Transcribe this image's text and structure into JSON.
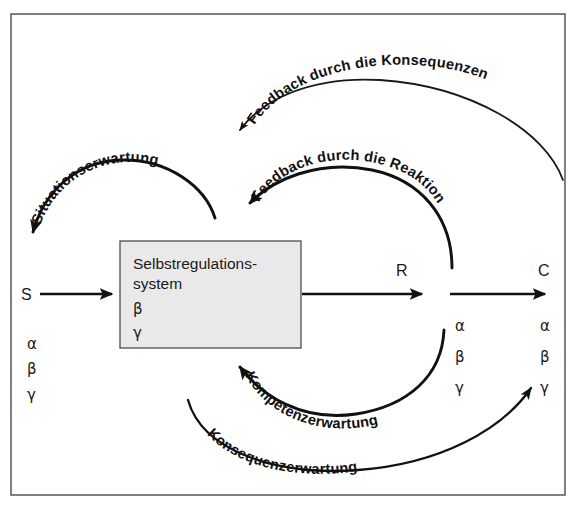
{
  "diagram": {
    "frame": {
      "border_color": "#4a4a4a"
    },
    "box": {
      "line1": "Selbstregulations-",
      "line2": "system",
      "greek": [
        "β",
        "γ"
      ],
      "fill_color": "#e9e9e9",
      "stroke_color": "#4d4d4d"
    },
    "nodes": [
      {
        "id": "S",
        "label": "S",
        "greek": [
          "α",
          "β",
          "γ"
        ]
      },
      {
        "id": "R",
        "label": "R",
        "greek": [
          "α",
          "β",
          "γ"
        ]
      },
      {
        "id": "C",
        "label": "C",
        "greek": [
          "α",
          "β",
          "γ"
        ]
      }
    ],
    "arcs": [
      {
        "id": "situationserwartung",
        "label": "Situationserwartung"
      },
      {
        "id": "feedback-konsequenzen",
        "label": "Feedback durch die Konsequenzen"
      },
      {
        "id": "feedback-reaktion",
        "label": "Feedback durch die Reaktion"
      },
      {
        "id": "kompetenzerwartung",
        "label": "Kompetenzerwartung"
      },
      {
        "id": "konsequenzerwartung",
        "label": "Konsequenzerwartung"
      }
    ],
    "arc_label_chars": {
      "situationserwartung": [
        "S",
        "i",
        "t",
        "u",
        "a",
        "t",
        "i",
        "o",
        "n",
        "s",
        "e",
        "r",
        "w",
        "a",
        "r",
        "t",
        "u",
        "n",
        "g"
      ],
      "feedback_konsequenzen": [
        "F",
        "e",
        "e",
        "d",
        "b",
        "a",
        "c",
        "k",
        " ",
        "d",
        "u",
        "r",
        "c",
        "h",
        " ",
        "d",
        "i",
        "e",
        " ",
        "K",
        "o",
        "n",
        "s",
        "e",
        "q",
        "u",
        "e",
        "n",
        "z",
        "e",
        "n"
      ],
      "feedback_reaktion": [
        "F",
        "e",
        "e",
        "d",
        "b",
        "a",
        "c",
        "k",
        " ",
        "d",
        "u",
        "r",
        "c",
        "h",
        " ",
        "d",
        "i",
        "e",
        " ",
        "R",
        "e",
        "a",
        "k",
        "t",
        "i",
        "o",
        "n"
      ],
      "kompetenzerwartung": [
        "K",
        "o",
        "m",
        "p",
        "e",
        "t",
        "e",
        "n",
        "z",
        "e",
        "r",
        "w",
        "a",
        "r",
        "t",
        "u",
        "n",
        "g"
      ],
      "konsequenzerwartung": [
        "K",
        "o",
        "n",
        "s",
        "e",
        "q",
        "u",
        "e",
        "n",
        "z",
        "e",
        "r",
        "w",
        "a",
        "r",
        "t",
        "u",
        "n",
        "g"
      ]
    }
  }
}
